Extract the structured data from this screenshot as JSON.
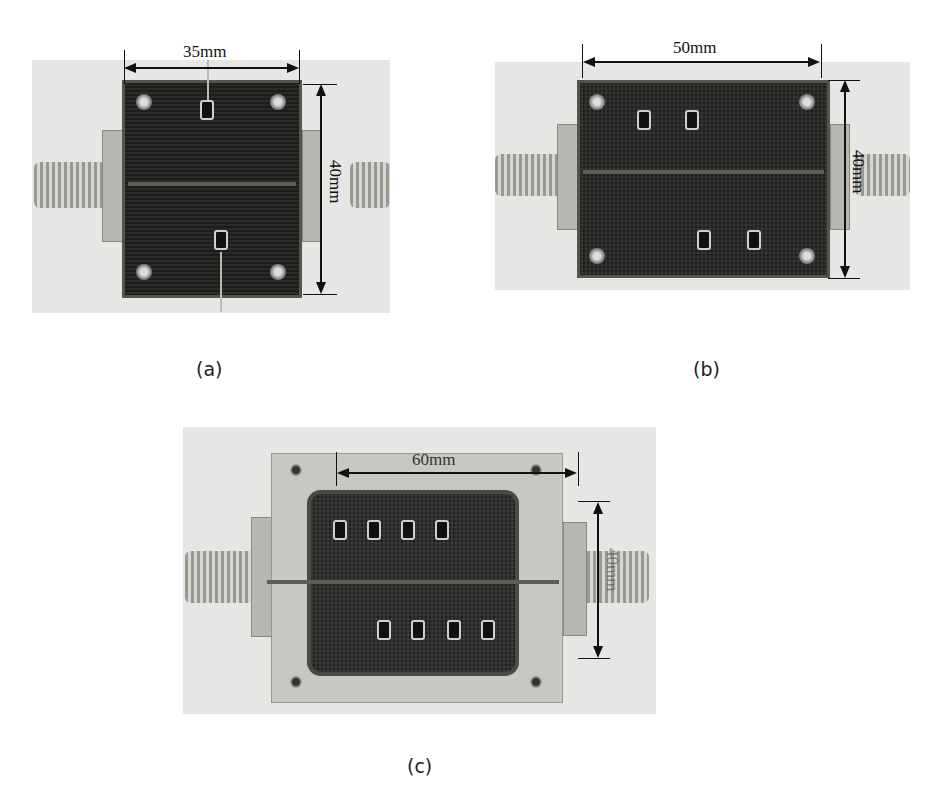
{
  "figure": {
    "panels": [
      {
        "id": "a",
        "caption": "(a)",
        "width_label": "35mm",
        "height_label": "40mm",
        "description": "Photo of fabricated filter prototype with two chip components"
      },
      {
        "id": "b",
        "caption": "(b)",
        "width_label": "50mm",
        "height_label": "40mm",
        "description": "Photo of fabricated filter prototype with four chip components"
      },
      {
        "id": "c",
        "caption": "(c)",
        "width_label": "60mm",
        "height_label": "40mm",
        "description": "Photo of fabricated filter prototype in metal housing with eight chip components"
      }
    ]
  },
  "colors": {
    "background": "#ffffff",
    "photo_bg": "#e6e6e4",
    "board": "#222222",
    "dimension_line": "#111111"
  }
}
